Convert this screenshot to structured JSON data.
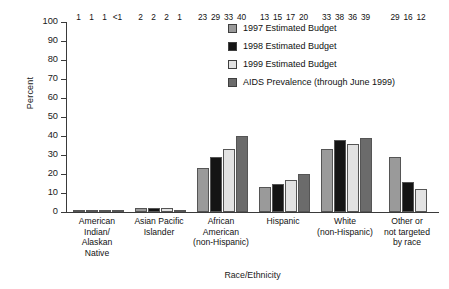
{
  "chart_data": {
    "type": "bar",
    "title": "",
    "xlabel": "Race/Ethnicity",
    "ylabel": "Percent",
    "ylim": [
      0,
      100
    ],
    "yticks": [
      0,
      10,
      20,
      30,
      40,
      50,
      60,
      70,
      80,
      90,
      100
    ],
    "grid": false,
    "legend_position": "top-right",
    "categories": [
      "American Indian/ Alaskan Native",
      "Asian Pacific Islander",
      "African American (non-Hispanic)",
      "Hispanic",
      "White (non-Hispanic)",
      "Other or not targeted by race"
    ],
    "category_lines": [
      [
        "American",
        "Indian/",
        "Alaskan",
        "Native"
      ],
      [
        "Asian Pacific",
        "Islander"
      ],
      [
        "African",
        "American",
        "(non-Hispanic)"
      ],
      [
        "Hispanic"
      ],
      [
        "White",
        "(non-Hispanic)"
      ],
      [
        "Other or",
        "not targeted",
        "by race"
      ]
    ],
    "series": [
      {
        "name": "1997 Estimated Budget",
        "color": "#9a9a9a",
        "values": [
          1,
          2,
          23,
          13,
          33,
          29
        ],
        "labels": [
          "1",
          "2",
          "23",
          "13",
          "33",
          "29"
        ]
      },
      {
        "name": "1998 Estimated Budget",
        "color": "#141414",
        "values": [
          1,
          2,
          29,
          15,
          38,
          16
        ],
        "labels": [
          "1",
          "2",
          "29",
          "15",
          "38",
          "16"
        ]
      },
      {
        "name": "1999 Estimated Budget",
        "color": "#e2e2e2",
        "values": [
          1,
          2,
          33,
          17,
          36,
          12
        ],
        "labels": [
          "1",
          "2",
          "33",
          "17",
          "36",
          "12"
        ]
      },
      {
        "name": "AIDS Prevalence (through June 1999)",
        "color": "#6b6b6b",
        "values": [
          0.6,
          1,
          40,
          20,
          39,
          null
        ],
        "labels": [
          "<1",
          "1",
          "40",
          "20",
          "39",
          null
        ]
      }
    ]
  },
  "legend": {
    "items": [
      {
        "label": "1997 Estimated Budget",
        "color": "#9a9a9a"
      },
      {
        "label": "1998 Estimated Budget",
        "color": "#141414"
      },
      {
        "label": "1999 Estimated Budget",
        "color": "#e2e2e2"
      },
      {
        "label": "AIDS Prevalence (through June 1999)",
        "color": "#6b6b6b"
      }
    ]
  }
}
